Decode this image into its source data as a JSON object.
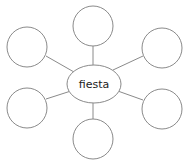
{
  "diagram": {
    "type": "word-web",
    "center": {
      "label": "fiesta"
    },
    "satellites": [
      {
        "position": "top",
        "label": ""
      },
      {
        "position": "top-left",
        "label": ""
      },
      {
        "position": "top-right",
        "label": ""
      },
      {
        "position": "bottom-left",
        "label": ""
      },
      {
        "position": "bottom-right",
        "label": ""
      },
      {
        "position": "bottom",
        "label": ""
      }
    ],
    "colors": {
      "stroke": "#8a8a8a",
      "line": "#8a8a8a",
      "background": "#ffffff",
      "text": "#222222"
    }
  }
}
